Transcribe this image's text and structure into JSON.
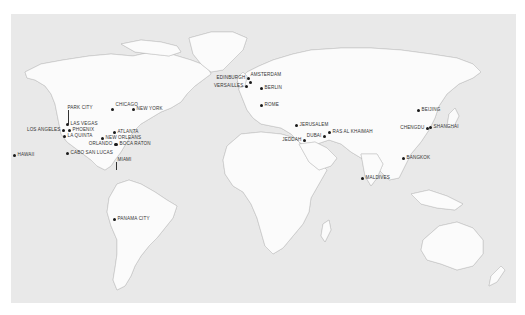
{
  "map": {
    "background": "#e9e9e9",
    "land_color": "#fbfbfb",
    "marker_color": "#1a1a1a",
    "locations": [
      {
        "id": "park-city",
        "label": "PARK CITY"
      },
      {
        "id": "las-vegas",
        "label": "LAS VEGAS"
      },
      {
        "id": "phoenix",
        "label": "PHOENIX"
      },
      {
        "id": "los-angeles",
        "label": "LOS ANGELES"
      },
      {
        "id": "la-quinta",
        "label": "LA QUINTA"
      },
      {
        "id": "cabo-san-lucas",
        "label": "CABO SAN LUCAS"
      },
      {
        "id": "hawaii",
        "label": "HAWAII"
      },
      {
        "id": "chicago",
        "label": "CHICAGO"
      },
      {
        "id": "new-york",
        "label": "NEW YORK"
      },
      {
        "id": "atlanta",
        "label": "ATLANTA"
      },
      {
        "id": "new-orleans",
        "label": "NEW ORLEANS"
      },
      {
        "id": "orlando",
        "label": "ORLANDO"
      },
      {
        "id": "boca-raton",
        "label": "BOCA RATON"
      },
      {
        "id": "miami",
        "label": "MIAMI"
      },
      {
        "id": "panama-city",
        "label": "PANAMA CITY"
      },
      {
        "id": "edinburgh",
        "label": "EDINBURGH"
      },
      {
        "id": "amsterdam",
        "label": "AMSTERDAM"
      },
      {
        "id": "versailles",
        "label": "VERSAILLES"
      },
      {
        "id": "berlin",
        "label": "BERLIN"
      },
      {
        "id": "rome",
        "label": "ROME"
      },
      {
        "id": "jerusalem",
        "label": "JERUSALEM"
      },
      {
        "id": "jeddah",
        "label": "JEDDAH"
      },
      {
        "id": "dubai",
        "label": "DUBAI"
      },
      {
        "id": "ras-al-khaimah",
        "label": "RAS AL KHAIMAH"
      },
      {
        "id": "maldives",
        "label": "MALDIVES"
      },
      {
        "id": "chengdu",
        "label": "CHENGDU"
      },
      {
        "id": "beijing",
        "label": "BEIJING"
      },
      {
        "id": "shanghai",
        "label": "SHANGHAI"
      },
      {
        "id": "bangkok",
        "label": "BANGKOK"
      }
    ]
  }
}
